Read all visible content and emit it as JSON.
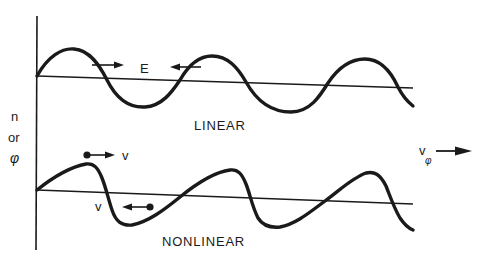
{
  "diagram": {
    "y_axis_label": {
      "line1": "n",
      "line2": "or",
      "line3": "φ"
    },
    "top_panel": {
      "label": "LINEAR",
      "field_label": "E"
    },
    "bottom_panel": {
      "label": "NONLINEAR",
      "particle_label_top": "v",
      "particle_label_bottom": "v"
    },
    "phase_velocity": {
      "label": "v",
      "subscript": "φ"
    },
    "colors": {
      "ink": "#1a1a1a",
      "background": "#ffffff"
    }
  }
}
